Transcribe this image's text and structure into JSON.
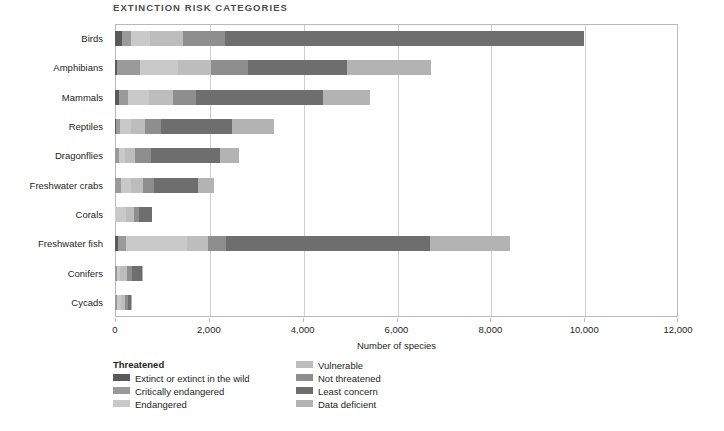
{
  "chart": {
    "title": "EXTINCTION RISK CATEGORIES",
    "xlabel": "Number of species"
  },
  "legend": {
    "heading": "Threatened",
    "left_items": [
      {
        "label": "Extinct or extinct in the wild",
        "color": "#5a5a5a"
      },
      {
        "label": "Critically endangered",
        "color": "#9a9a9a"
      },
      {
        "label": "Endangered",
        "color": "#c9c9c9"
      }
    ],
    "right_items": [
      {
        "label": "Vulnerable",
        "color": "#bdbdbd"
      },
      {
        "label": "Not threatened",
        "color": "#8e8e8e"
      },
      {
        "label": "Least concern",
        "color": "#6e6e6e"
      },
      {
        "label": "Data deficient",
        "color": "#b3b3b3"
      }
    ]
  },
  "chart_data": {
    "type": "bar",
    "orientation": "horizontal",
    "stacked": true,
    "title": "EXTINCTION RISK CATEGORIES",
    "xlabel": "Number of species",
    "ylabel": "",
    "xlim": [
      0,
      12000
    ],
    "xticks": [
      0,
      2000,
      4000,
      6000,
      8000,
      10000,
      12000
    ],
    "xtick_labels": [
      "0",
      "2,000",
      "4,000",
      "6,000",
      "8,000",
      "10,000",
      "12,000"
    ],
    "grid": true,
    "legend_position": "below-left",
    "categories": [
      "Birds",
      "Amphibians",
      "Mammals",
      "Reptiles",
      "Dragonflies",
      "Freshwater crabs",
      "Corals",
      "Freshwater fish",
      "Conifers",
      "Cycads"
    ],
    "series": [
      {
        "name": "Extinct or extinct in the wild",
        "color": "#5a5a5a",
        "values": [
          140,
          40,
          80,
          25,
          2,
          1,
          0,
          70,
          5,
          2
        ]
      },
      {
        "name": "Critically endangered",
        "color": "#9a9a9a",
        "values": [
          200,
          500,
          200,
          80,
          80,
          120,
          0,
          170,
          30,
          50
        ]
      },
      {
        "name": "Endangered",
        "color": "#c9c9c9",
        "values": [
          400,
          800,
          450,
          230,
          130,
          210,
          230,
          1300,
          80,
          80
        ]
      },
      {
        "name": "Vulnerable",
        "color": "#bdbdbd",
        "values": [
          700,
          700,
          500,
          310,
          220,
          270,
          170,
          450,
          140,
          90
        ]
      },
      {
        "name": "Not threatened",
        "color": "#8e8e8e",
        "values": [
          900,
          800,
          500,
          330,
          330,
          240,
          110,
          380,
          110,
          60
        ]
      },
      {
        "name": "Least concern",
        "color": "#6e6e6e",
        "values": [
          7660,
          2100,
          2700,
          1510,
          1480,
          930,
          270,
          4350,
          210,
          60
        ]
      },
      {
        "name": "Data deficient",
        "color": "#b3b3b3",
        "values": [
          0,
          1800,
          1000,
          900,
          410,
          330,
          0,
          1700,
          20,
          10
        ]
      }
    ]
  }
}
